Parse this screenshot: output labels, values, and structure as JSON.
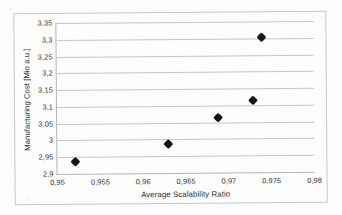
{
  "chart_data": {
    "type": "scatter",
    "title": "",
    "xlabel": "Average Scalability Ratio",
    "ylabel": "Manufacturing Cost [Mio a.u.]",
    "xlim": [
      0.95,
      0.98
    ],
    "ylim": [
      2.9,
      3.35
    ],
    "xtick_step": 0.005,
    "ytick_step": 0.05,
    "decimal_separator": ",",
    "grid": "horizontal",
    "legend": "none",
    "marker": "black-diamond",
    "xticks": [
      "0,95",
      "0,955",
      "0,96",
      "0,965",
      "0,97",
      "0,975",
      "0,98"
    ],
    "xtick_values": [
      0.95,
      0.955,
      0.96,
      0.965,
      0.97,
      0.975,
      0.98
    ],
    "yticks": [
      "2,9",
      "2,95",
      "3",
      "3,05",
      "3,1",
      "3,15",
      "3,2",
      "3,25",
      "3,3",
      "3,35"
    ],
    "ytick_values": [
      2.9,
      2.95,
      3.0,
      3.05,
      3.1,
      3.15,
      3.2,
      3.25,
      3.3,
      3.35
    ],
    "points": [
      {
        "x": 0.9521,
        "y": 2.935
      },
      {
        "x": 0.9629,
        "y": 2.985
      },
      {
        "x": 0.9688,
        "y": 3.063
      },
      {
        "x": 0.9729,
        "y": 3.116
      },
      {
        "x": 0.9739,
        "y": 3.301
      }
    ],
    "series": [
      {
        "name": "Manufacturing Cost",
        "x": [
          0.9521,
          0.9629,
          0.9688,
          0.9729,
          0.9739
        ],
        "values": [
          2.935,
          2.985,
          3.063,
          3.116,
          3.301
        ]
      }
    ]
  },
  "colors": {
    "marker": "#161616",
    "gridline": "#c6c6c6",
    "axis": "#b4b4b4",
    "frame": "#c9c9c9",
    "text": "#2e2e2e",
    "background": "#fdfdfd"
  }
}
